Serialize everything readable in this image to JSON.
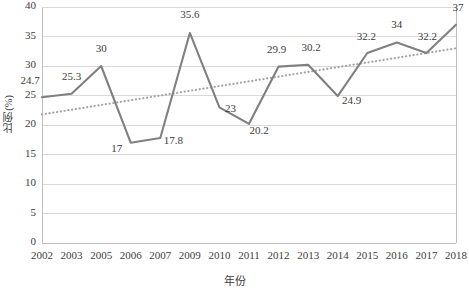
{
  "chart_data": {
    "type": "line",
    "title": "",
    "xlabel": "年份",
    "ylabel": "比例(%)",
    "ylim": [
      0,
      40
    ],
    "yticks": [
      0,
      5,
      10,
      15,
      20,
      25,
      30,
      35,
      40
    ],
    "grid": true,
    "legend": "none",
    "categories": [
      "2002",
      "2003",
      "2005",
      "2006",
      "2007",
      "2009",
      "2010",
      "2011",
      "2012",
      "2013",
      "2014",
      "2015",
      "2016",
      "2017",
      "2018"
    ],
    "series": [
      {
        "name": "比例(%)",
        "type": "line",
        "color": "#808080",
        "values": [
          24.7,
          25.3,
          30,
          17,
          17.8,
          35.6,
          23,
          20.2,
          29.9,
          30.2,
          24.9,
          32.2,
          34,
          32.2,
          37
        ],
        "labels": [
          "24.7",
          "25.3",
          "30",
          "17",
          "17.8",
          "35.6",
          "23",
          "20.2",
          "29.9",
          "30.2",
          "24.9",
          "32.2",
          "34",
          "32.2",
          "37"
        ]
      },
      {
        "name": "线性趋势线",
        "type": "trendline",
        "style": "dotted",
        "color": "#a6a6a6",
        "start_value": 21.8,
        "end_value": 33.0
      }
    ],
    "colors": {
      "series_line": "#808080",
      "trendline": "#a6a6a6",
      "gridline": "#d9d9d9",
      "frame": "#bfbfbf",
      "text": "#404040",
      "background": "#ffffff"
    }
  }
}
